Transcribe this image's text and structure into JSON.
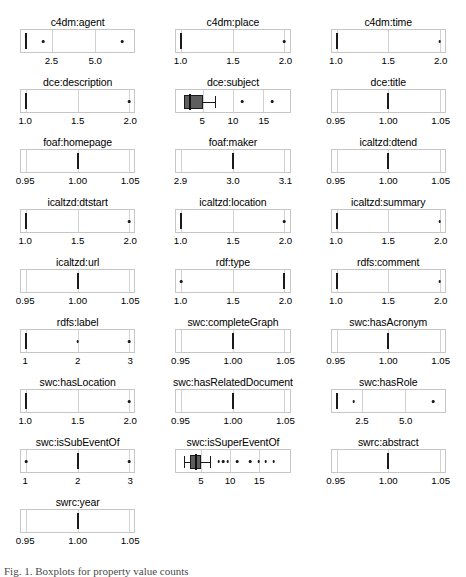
{
  "figure": {
    "caption_fragment": "Fig. 1. Boxplots for property value counts",
    "panel_columns": 3,
    "colors": {
      "box_fill": "#5e5e5e",
      "box_stroke": "#1a1a1a",
      "panel_border": "#c6c6c6",
      "gridline": "#d2d2d2",
      "text": "#000000"
    }
  },
  "chart_data": {
    "type": "box",
    "title": "",
    "xlabel": "",
    "ylabel": "",
    "grid": true,
    "legend": "none",
    "panels": [
      {
        "title": "c4dm:agent",
        "xlim": [
          1,
          7
        ],
        "ticks": [
          {
            "value": 2.5,
            "label": "2.5"
          },
          {
            "value": 5.0,
            "label": "5.0"
          }
        ],
        "median": 1.0,
        "box": null,
        "whisker_low": null,
        "whisker_high": null,
        "outliers": [
          2.0,
          6.6
        ]
      },
      {
        "title": "c4dm:place",
        "xlim": [
          1.0,
          2.0
        ],
        "ticks": [
          {
            "value": 1.0,
            "label": "1.0"
          },
          {
            "value": 1.5,
            "label": "1.5"
          },
          {
            "value": 2.0,
            "label": "2.0"
          }
        ],
        "median": 1.0,
        "box": null,
        "whisker_low": null,
        "whisker_high": null,
        "outliers": [
          2.0
        ]
      },
      {
        "title": "c4dm:time",
        "xlim": [
          1.0,
          2.0
        ],
        "ticks": [
          {
            "value": 1.0,
            "label": "1.0"
          },
          {
            "value": 1.5,
            "label": "1.5"
          },
          {
            "value": 2.0,
            "label": "2.0"
          }
        ],
        "median": 1.0,
        "box": null,
        "whisker_low": null,
        "whisker_high": null,
        "outliers": [
          2.0
        ]
      },
      {
        "title": "dce:description",
        "xlim": [
          1.0,
          2.0
        ],
        "ticks": [
          {
            "value": 1.0,
            "label": "1.0"
          },
          {
            "value": 1.5,
            "label": "1.5"
          },
          {
            "value": 2.0,
            "label": "2.0"
          }
        ],
        "median": 1.0,
        "box": null,
        "whisker_low": null,
        "whisker_high": null,
        "outliers": [
          2.0
        ]
      },
      {
        "title": "dce:subject",
        "xlim": [
          1.5,
          18.5
        ],
        "ticks": [
          {
            "value": 5,
            "label": "5"
          },
          {
            "value": 10,
            "label": "10"
          },
          {
            "value": 15,
            "label": "15"
          }
        ],
        "median": 3.0,
        "box": [
          2.0,
          5.0
        ],
        "whisker_low": 2.0,
        "whisker_high": 7.0,
        "outliers": [
          11.5,
          16.5
        ]
      },
      {
        "title": "dce:title",
        "xlim": [
          0.95,
          1.05
        ],
        "ticks": [
          {
            "value": 0.95,
            "label": "0.95"
          },
          {
            "value": 1.0,
            "label": "1.00"
          },
          {
            "value": 1.05,
            "label": "1.05"
          }
        ],
        "median": 1.0,
        "box": null,
        "whisker_low": null,
        "whisker_high": null,
        "outliers": []
      },
      {
        "title": "foaf:homepage",
        "xlim": [
          0.95,
          1.05
        ],
        "ticks": [
          {
            "value": 0.95,
            "label": "0.95"
          },
          {
            "value": 1.0,
            "label": "1.00"
          },
          {
            "value": 1.05,
            "label": "1.05"
          }
        ],
        "median": 1.0,
        "box": null,
        "whisker_low": null,
        "whisker_high": null,
        "outliers": []
      },
      {
        "title": "foaf:maker",
        "xlim": [
          2.9,
          3.1
        ],
        "ticks": [
          {
            "value": 2.9,
            "label": "2.9"
          },
          {
            "value": 3.0,
            "label": "3.0"
          },
          {
            "value": 3.1,
            "label": "3.1"
          }
        ],
        "median": 3.0,
        "box": null,
        "whisker_low": null,
        "whisker_high": null,
        "outliers": []
      },
      {
        "title": "icaltzd:dtend",
        "xlim": [
          0.95,
          1.05
        ],
        "ticks": [
          {
            "value": 0.95,
            "label": "0.95"
          },
          {
            "value": 1.0,
            "label": "1.00"
          },
          {
            "value": 1.05,
            "label": "1.05"
          }
        ],
        "median": 1.0,
        "box": null,
        "whisker_low": null,
        "whisker_high": null,
        "outliers": []
      },
      {
        "title": "icaltzd:dtstart",
        "xlim": [
          1.0,
          2.0
        ],
        "ticks": [
          {
            "value": 1.0,
            "label": "1.0"
          },
          {
            "value": 1.5,
            "label": "1.5"
          },
          {
            "value": 2.0,
            "label": "2.0"
          }
        ],
        "median": 1.0,
        "box": null,
        "whisker_low": null,
        "whisker_high": null,
        "outliers": [
          2.0
        ]
      },
      {
        "title": "icaltzd:location",
        "xlim": [
          1.0,
          2.0
        ],
        "ticks": [
          {
            "value": 1.0,
            "label": "1.0"
          },
          {
            "value": 1.5,
            "label": "1.5"
          },
          {
            "value": 2.0,
            "label": "2.0"
          }
        ],
        "median": 1.0,
        "box": null,
        "whisker_low": null,
        "whisker_high": null,
        "outliers": [
          2.0
        ]
      },
      {
        "title": "icaltzd:summary",
        "xlim": [
          1.0,
          2.0
        ],
        "ticks": [
          {
            "value": 1.0,
            "label": "1.0"
          },
          {
            "value": 1.5,
            "label": "1.5"
          },
          {
            "value": 2.0,
            "label": "2.0"
          }
        ],
        "median": 1.0,
        "box": null,
        "whisker_low": null,
        "whisker_high": null,
        "outliers": [
          2.0
        ]
      },
      {
        "title": "icaltzd:url",
        "xlim": [
          0.95,
          1.05
        ],
        "ticks": [
          {
            "value": 0.95,
            "label": "0.95"
          },
          {
            "value": 1.0,
            "label": "1.00"
          },
          {
            "value": 1.05,
            "label": "1.05"
          }
        ],
        "median": 1.0,
        "box": null,
        "whisker_low": null,
        "whisker_high": null,
        "outliers": []
      },
      {
        "title": "rdf:type",
        "xlim": [
          1.0,
          2.0
        ],
        "ticks": [
          {
            "value": 1.0,
            "label": "1.0"
          },
          {
            "value": 1.5,
            "label": "1.5"
          },
          {
            "value": 2.0,
            "label": "2.0"
          }
        ],
        "median": 2.0,
        "box": null,
        "whisker_low": null,
        "whisker_high": null,
        "outliers": [
          1.0
        ]
      },
      {
        "title": "rdfs:comment",
        "xlim": [
          1.0,
          2.0
        ],
        "ticks": [
          {
            "value": 1.0,
            "label": "1.0"
          },
          {
            "value": 1.5,
            "label": "1.5"
          },
          {
            "value": 2.0,
            "label": "2.0"
          }
        ],
        "median": 1.0,
        "box": null,
        "whisker_low": null,
        "whisker_high": null,
        "outliers": [
          2.0
        ]
      },
      {
        "title": "rdfs:label",
        "xlim": [
          1,
          3
        ],
        "ticks": [
          {
            "value": 1,
            "label": "1"
          },
          {
            "value": 2,
            "label": "2"
          },
          {
            "value": 3,
            "label": "3"
          }
        ],
        "median": 1.0,
        "box": null,
        "whisker_low": null,
        "whisker_high": null,
        "outliers": [
          2.0,
          3.0
        ]
      },
      {
        "title": "swc:completeGraph",
        "xlim": [
          0.95,
          1.05
        ],
        "ticks": [
          {
            "value": 0.95,
            "label": "0.95"
          },
          {
            "value": 1.0,
            "label": "1.00"
          },
          {
            "value": 1.05,
            "label": "1.05"
          }
        ],
        "median": 1.0,
        "box": null,
        "whisker_low": null,
        "whisker_high": null,
        "outliers": []
      },
      {
        "title": "swc:hasAcronym",
        "xlim": [
          0.95,
          1.05
        ],
        "ticks": [
          {
            "value": 0.95,
            "label": "0.95"
          },
          {
            "value": 1.0,
            "label": "1.00"
          },
          {
            "value": 1.05,
            "label": "1.05"
          }
        ],
        "median": 1.0,
        "box": null,
        "whisker_low": null,
        "whisker_high": null,
        "outliers": []
      },
      {
        "title": "swc:hasLocation",
        "xlim": [
          1.0,
          2.0
        ],
        "ticks": [
          {
            "value": 1.0,
            "label": "1.0"
          },
          {
            "value": 1.5,
            "label": "1.5"
          },
          {
            "value": 2.0,
            "label": "2.0"
          }
        ],
        "median": 1.0,
        "box": null,
        "whisker_low": null,
        "whisker_high": null,
        "outliers": [
          2.0
        ]
      },
      {
        "title": "swc:hasRelatedDocument",
        "xlim": [
          0.95,
          1.05
        ],
        "ticks": [
          {
            "value": 0.95,
            "label": "0.95"
          },
          {
            "value": 1.0,
            "label": "1.00"
          },
          {
            "value": 1.05,
            "label": "1.05"
          }
        ],
        "median": 1.0,
        "box": null,
        "whisker_low": null,
        "whisker_high": null,
        "outliers": []
      },
      {
        "title": "swc:hasRole",
        "xlim": [
          1,
          7
        ],
        "ticks": [
          {
            "value": 2.5,
            "label": "2.5"
          },
          {
            "value": 5.0,
            "label": "5.0"
          }
        ],
        "median": 1.0,
        "box": null,
        "whisker_low": null,
        "whisker_high": null,
        "outliers": [
          2.0,
          6.6
        ]
      },
      {
        "title": "swc:isSubEventOf",
        "xlim": [
          1,
          3
        ],
        "ticks": [
          {
            "value": 1,
            "label": "1"
          },
          {
            "value": 2,
            "label": "2"
          },
          {
            "value": 3,
            "label": "3"
          }
        ],
        "median": 2.0,
        "box": null,
        "whisker_low": null,
        "whisker_high": null,
        "outliers": [
          1.0,
          3.0
        ]
      },
      {
        "title": "swc:isSuperEventOf",
        "xlim": [
          1.5,
          19.5
        ],
        "ticks": [
          {
            "value": 5,
            "label": "5"
          },
          {
            "value": 10,
            "label": "10"
          },
          {
            "value": 15,
            "label": "15"
          }
        ],
        "median": 4.0,
        "box": [
          3.0,
          5.0
        ],
        "whisker_low": 2.0,
        "whisker_high": 6.5,
        "outliers": [
          8.0,
          8.8,
          9.6,
          11.2,
          13.5,
          15.0,
          16.2,
          17.6
        ]
      },
      {
        "title": "swrc:abstract",
        "xlim": [
          0.95,
          1.05
        ],
        "ticks": [
          {
            "value": 0.95,
            "label": "0.95"
          },
          {
            "value": 1.0,
            "label": "1.00"
          },
          {
            "value": 1.05,
            "label": "1.05"
          }
        ],
        "median": 1.0,
        "box": null,
        "whisker_low": null,
        "whisker_high": null,
        "outliers": []
      },
      {
        "title": "swrc:year",
        "xlim": [
          0.95,
          1.05
        ],
        "ticks": [
          {
            "value": 0.95,
            "label": "0.95"
          },
          {
            "value": 1.0,
            "label": "1.00"
          },
          {
            "value": 1.05,
            "label": "1.05"
          }
        ],
        "median": 1.0,
        "box": null,
        "whisker_low": null,
        "whisker_high": null,
        "outliers": []
      }
    ]
  }
}
